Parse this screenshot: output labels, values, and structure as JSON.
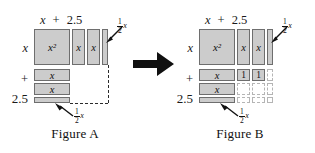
{
  "diagram": {
    "title_a": "Figure A",
    "title_b": "Figure B",
    "transition_icon": "right-arrow-icon"
  },
  "figure_a": {
    "caption": "Figure A",
    "top_labels": {
      "term1": "x",
      "operator": "+",
      "term2": "2.5"
    },
    "side_labels": {
      "term1": "x",
      "operator": "+",
      "term2": "2.5"
    },
    "tiles": [
      {
        "id": "x-squared",
        "label": "x²",
        "kind": "shaded"
      },
      {
        "id": "x-vertical-1",
        "label": "x",
        "kind": "shaded"
      },
      {
        "id": "x-vertical-2",
        "label": "x",
        "kind": "shaded"
      },
      {
        "id": "half-x-vertical",
        "label": "",
        "kind": "shaded-strip"
      },
      {
        "id": "x-horizontal-1",
        "label": "x",
        "kind": "shaded"
      },
      {
        "id": "x-horizontal-2",
        "label": "x",
        "kind": "shaded"
      },
      {
        "id": "half-x-horizontal",
        "label": "",
        "kind": "shaded-strip"
      }
    ],
    "annotations": {
      "top_right_fraction_num": "1",
      "top_right_fraction_den": "2",
      "top_right_variable": "x",
      "bottom_fraction_num": "1",
      "bottom_fraction_den": "2",
      "bottom_variable": "x"
    }
  },
  "figure_b": {
    "caption": "Figure B",
    "top_labels": {
      "term1": "x",
      "operator": "+",
      "term2": "2.5"
    },
    "side_labels": {
      "term1": "x",
      "operator": "+",
      "term2": "2.5"
    },
    "tiles": [
      {
        "id": "x-squared",
        "label": "x²",
        "kind": "shaded"
      },
      {
        "id": "x-vertical-1",
        "label": "x",
        "kind": "shaded"
      },
      {
        "id": "x-vertical-2",
        "label": "x",
        "kind": "shaded"
      },
      {
        "id": "half-x-vertical",
        "label": "",
        "kind": "shaded-strip"
      },
      {
        "id": "x-horizontal-1",
        "label": "x",
        "kind": "shaded"
      },
      {
        "id": "x-horizontal-2",
        "label": "x",
        "kind": "shaded"
      },
      {
        "id": "half-x-horizontal",
        "label": "",
        "kind": "shaded-strip"
      },
      {
        "id": "unit-tile-1",
        "label": "1",
        "kind": "shaded-unit"
      },
      {
        "id": "unit-tile-2",
        "label": "1",
        "kind": "shaded-unit"
      }
    ],
    "placeholders": [
      {
        "id": "ghost-r1-c3"
      },
      {
        "id": "ghost-r2-c1"
      },
      {
        "id": "ghost-r2-c2"
      },
      {
        "id": "ghost-r2-c3"
      },
      {
        "id": "ghost-r3-c1"
      },
      {
        "id": "ghost-r3-c2"
      },
      {
        "id": "ghost-r3-c3"
      }
    ],
    "annotations": {
      "top_right_fraction_num": "1",
      "top_right_fraction_den": "2",
      "top_right_variable": "x",
      "bottom_fraction_num": "1",
      "bottom_fraction_den": "2",
      "bottom_variable": "x"
    }
  },
  "colors": {
    "tile_fill": "#cccccc",
    "tile_border": "#6e6e6e",
    "ghost_border": "#b5b5b5",
    "dash_line": "#2b2b2b",
    "arrow": "#101010",
    "text": "#111111",
    "background": "#ffffff"
  }
}
